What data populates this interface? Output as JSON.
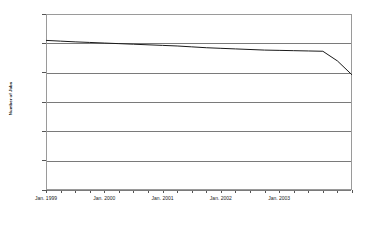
{
  "chart_data": {
    "type": "line",
    "title": "",
    "xlabel": "",
    "ylabel": "Number of Jobs",
    "ylim": [
      150000,
      270000
    ],
    "ytick_step": 20000,
    "ytick_labels": [
      "270,000",
      "250,000",
      "230,000",
      "210,000",
      "190,000",
      "170,000",
      "150,000"
    ],
    "ytick_values": [
      270000,
      250000,
      230000,
      210000,
      190000,
      170000,
      150000
    ],
    "xtick_labels": [
      "Jan. 1999",
      "Jan. 2000",
      "Jan. 2001",
      "Jan. 2002",
      "Jan. 2003"
    ],
    "grid": true,
    "legend": "none",
    "line_color": "#1a1a1a",
    "series": [
      {
        "name": "Number of Jobs",
        "x": [
          "Jan. 1999",
          "Apr. 1999",
          "Jul. 1999",
          "Oct. 1999",
          "Jan. 2000",
          "Apr. 2000",
          "Jul. 2000",
          "Oct. 2000",
          "Jan. 2001",
          "Apr. 2001",
          "Jul. 2001",
          "Oct. 2001",
          "Jan. 2002",
          "Apr. 2002",
          "Jul. 2002",
          "Oct. 2002",
          "Jan. 2003",
          "Apr. 2003",
          "Jul. 2003",
          "Oct. 2003",
          "Jan. 2004",
          "Apr. 2004"
        ],
        "values": [
          252000,
          251500,
          251000,
          250600,
          250200,
          249800,
          249400,
          249000,
          248600,
          248200,
          247600,
          247000,
          246600,
          246200,
          245800,
          245400,
          245200,
          245000,
          244800,
          244600,
          238000,
          228500
        ]
      }
    ]
  }
}
